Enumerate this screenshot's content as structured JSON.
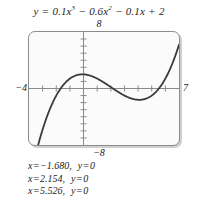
{
  "figure": {
    "caption_equation": {
      "lhs": "y",
      "equals": "=",
      "term1_coef": "0.1",
      "term1_var": "x",
      "term1_exp": "3",
      "sign1": "−",
      "term2_coef": "0.6",
      "term2_var": "x",
      "term2_exp": "2",
      "sign2": "−",
      "term3_coef": "0.1",
      "term3_var": "x",
      "sign3": "+",
      "term4": "2",
      "full_text": "y = 0.1x³ − 0.6x² − 0.1x + 2"
    },
    "window": {
      "xmin_label": "−4",
      "xmax_label": "7",
      "ymax_label": "8",
      "ymin_label": "−8",
      "xmin": -4,
      "xmax": 7,
      "ymin": -8,
      "ymax": 8,
      "xscl": 1,
      "yscl": 1
    },
    "solutions": [
      {
        "x_label": "x",
        "x_eq": "=",
        "x_value": "−1.680,",
        "y_label": "y",
        "y_eq": "=",
        "y_value": "0"
      },
      {
        "x_label": "x",
        "x_eq": "=",
        "x_value": "2.154,",
        "y_label": "y",
        "y_eq": "=",
        "y_value": "0"
      },
      {
        "x_label": "x",
        "x_eq": "=",
        "x_value": "5.526,",
        "y_label": "y",
        "y_eq": "=",
        "y_value": "0"
      }
    ],
    "colors": {
      "curve": "#3b3b3b",
      "axis": "#8a8a8a",
      "frame": "#8c8c8c",
      "screen_fill": "#fbfbfb",
      "shadow": "#cfcfcf",
      "text": "#232323"
    }
  },
  "chart_data": {
    "type": "line",
    "xlabel": "",
    "ylabel": "",
    "xlim": [
      -4,
      7
    ],
    "ylim": [
      -8,
      8
    ],
    "xticks": [
      -4,
      -3,
      -2,
      -1,
      0,
      1,
      2,
      3,
      4,
      5,
      6,
      7
    ],
    "yticks": [
      -8,
      -7,
      -6,
      -5,
      -4,
      -3,
      -2,
      -1,
      0,
      1,
      2,
      3,
      4,
      5,
      6,
      7,
      8
    ],
    "grid": false,
    "legend": "none",
    "equation_coefficients": {
      "a": 0.1,
      "b": -0.6,
      "c": -0.1,
      "d": 2
    },
    "roots": [
      -1.68,
      2.154,
      5.526
    ],
    "annotations": [
      "x = −1.680,  y = 0",
      "x = 2.154,  y = 0",
      "x = 5.526,  y = 0"
    ],
    "series": [
      {
        "name": "y = 0.1x^3 - 0.6x^2 - 0.1x + 2",
        "x": [
          -4,
          -3.6,
          -3.2,
          -2.8,
          -2.4,
          -2,
          -1.68,
          -1.6,
          -1.2,
          -0.8,
          -0.4,
          0,
          0.4,
          0.8,
          1.2,
          1.6,
          2,
          2.154,
          2.4,
          2.8,
          3.2,
          3.6,
          4,
          4.4,
          4.8,
          5.2,
          5.526,
          5.6,
          6,
          6.4,
          6.8,
          7
        ],
        "y": [
          -9.4,
          -7.53,
          -5.91,
          -8.53,
          -4.46,
          -3.0,
          -2.0,
          -1.68,
          -0.47,
          0.63,
          1.54,
          2.0,
          2.05,
          1.6,
          1.17,
          0.51,
          -0.2,
          0.0,
          -0.93,
          -1.58,
          -2.12,
          -2.42,
          -2.4,
          -2.0,
          -1.17,
          0.14,
          0.0,
          0.66,
          2.0,
          4.16,
          7.24,
          9.6
        ]
      }
    ],
    "curve_description": "Cubic with local maximum near x = -0.09 (y ≈ 2.0) and local minimum near x = 4.09 (y ≈ -2.4); rises steeply on both far ends within the viewing window."
  }
}
